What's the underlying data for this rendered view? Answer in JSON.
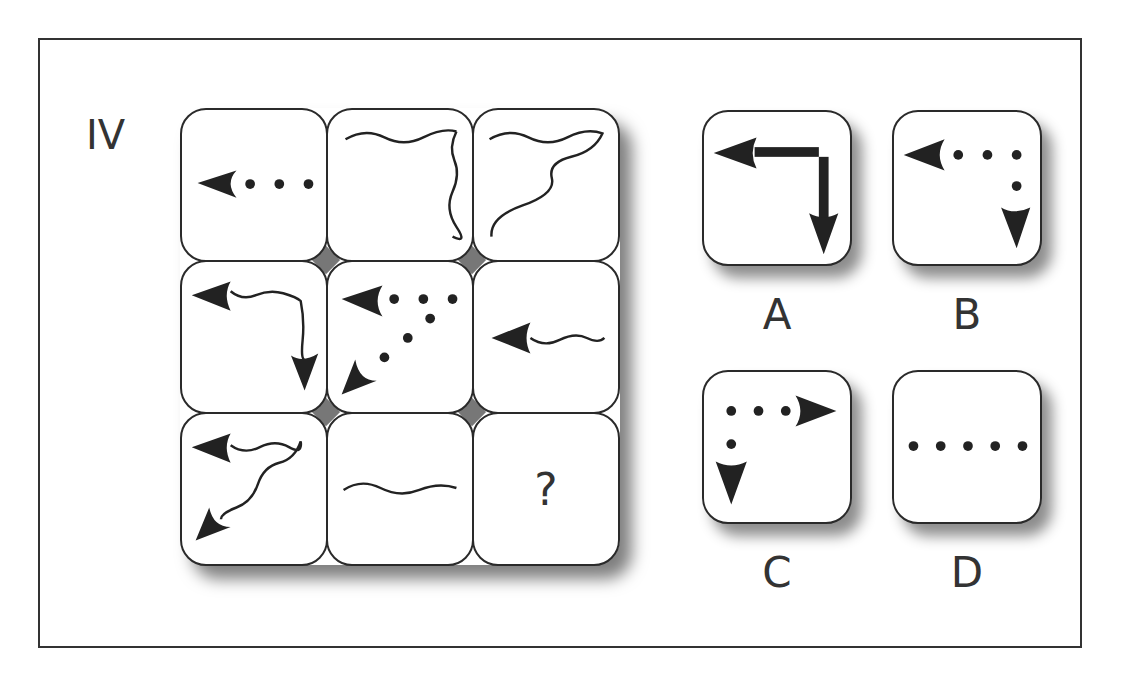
{
  "puzzle": {
    "set_label": "IV",
    "missing_marker": "?",
    "grid": [
      [
        {
          "id": "r1c1",
          "content": "left arrowhead with 3 dots trailing right (horizontal dotted arrow pointing left)"
        },
        {
          "id": "r1c2",
          "content": "wavy line along top turning down the right side (no arrowheads)"
        },
        {
          "id": "r1c3",
          "content": "wavy line along top and wavy diagonal from top-right to bottom-left (no arrowheads)"
        }
      ],
      [
        {
          "id": "r2c1",
          "content": "wavy line top with left arrowhead, and wavy line down right side with down arrowhead"
        },
        {
          "id": "r2c2",
          "content": "dots along top with left arrowhead, and dots diagonally to bottom-left arrowhead"
        },
        {
          "id": "r2c3",
          "content": "wavy horizontal line with left arrowhead"
        }
      ],
      [
        {
          "id": "r3c1",
          "content": "wavy top line with left arrowhead and wavy diagonal with bottom-left arrowhead"
        },
        {
          "id": "r3c2",
          "content": "wavy horizontal line (no arrowheads)"
        },
        {
          "id": "r3c3",
          "content": "?"
        }
      ]
    ],
    "options": [
      {
        "label": "A",
        "content": "solid line top with left arrowhead, solid line right side with down arrowhead"
      },
      {
        "label": "B",
        "content": "dots along top with left arrowhead, dot down right side with down arrowhead"
      },
      {
        "label": "C",
        "content": "dots along top with right arrowhead, dot down left side with down arrowhead"
      },
      {
        "label": "D",
        "content": "five dots horizontal (no arrowheads)"
      }
    ]
  },
  "colors": {
    "ink": "#222222",
    "frame": "#333333",
    "background": "#ffffff",
    "gap_fill": "#777777"
  }
}
